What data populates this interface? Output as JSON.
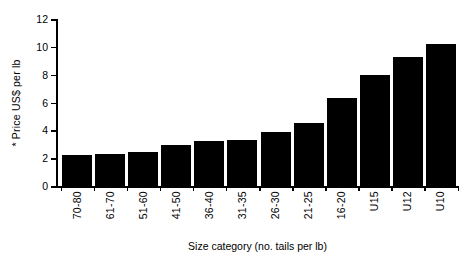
{
  "chart_data": {
    "type": "bar",
    "title": "",
    "xlabel": "Size category (no. tails per lb)",
    "ylabel": "* Price US$ per lb",
    "categories": [
      "70-80",
      "61-70",
      "51-60",
      "41-50",
      "36-40",
      "31-35",
      "26-30",
      "21-25",
      "16-20",
      "U15",
      "U12",
      "U10"
    ],
    "values": [
      2.25,
      2.3,
      2.45,
      2.95,
      3.2,
      3.3,
      3.85,
      4.55,
      6.35,
      8.0,
      9.3,
      10.2
    ],
    "ylim": [
      0,
      12
    ],
    "ytick_labels": [
      "0",
      "2",
      "4",
      "6",
      "8",
      "10",
      "12"
    ],
    "ytick_values": [
      0,
      2,
      4,
      6,
      8,
      10,
      12
    ],
    "grid": false,
    "legend": null,
    "bar_color": "#000000",
    "axis_color": "#000000",
    "background_color": "#ffffff"
  }
}
